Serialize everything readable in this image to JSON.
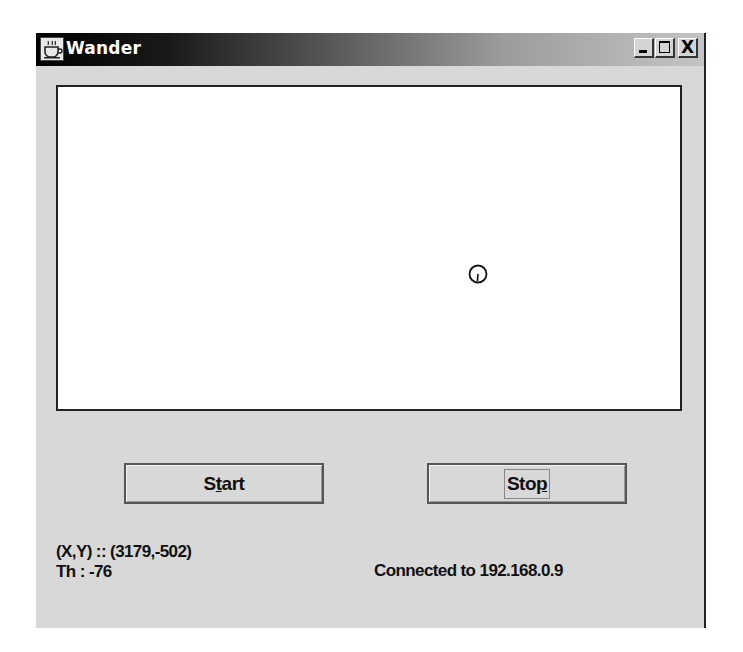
{
  "window": {
    "title": "Wander",
    "icon": "java-cup-icon",
    "controls": {
      "minimize": "minimize-icon",
      "maximize": "maximize-icon",
      "close": "close-icon",
      "close_glyph": "X"
    }
  },
  "canvas": {
    "background": "#ffffff",
    "robot": {
      "shape": "circle-with-heading-line",
      "screen_x": 477,
      "screen_y": 276
    }
  },
  "buttons": {
    "start": {
      "label_pre": "S",
      "label_mnemonic": "t",
      "label_post": "art"
    },
    "stop": {
      "label_pre": "Sto",
      "label_mnemonic": "p",
      "label_post": ""
    }
  },
  "status": {
    "position": "(X,Y) :: (3179,-502)",
    "heading": "Th : -76",
    "connection": "Connected to 192.168.0.9"
  },
  "colors": {
    "window_bg": "#d8d8d8",
    "titlebar_start": "#000000",
    "titlebar_end": "#c4c4c4",
    "title_text": "#ffffff",
    "border": "#222222"
  }
}
